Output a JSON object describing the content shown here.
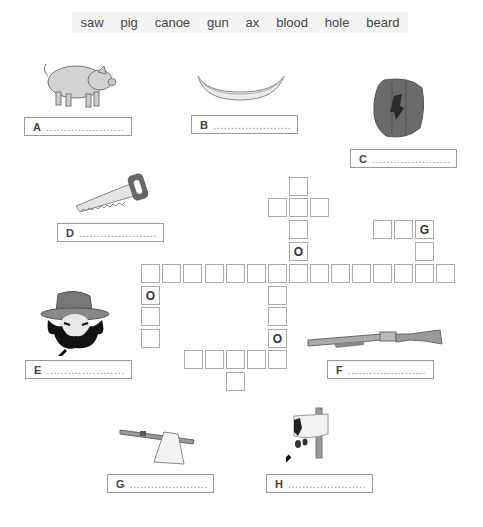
{
  "word_bank": [
    "saw",
    "pig",
    "canoe",
    "gun",
    "ax",
    "blood",
    "hole",
    "beard"
  ],
  "answer_boxes": [
    {
      "label": "A",
      "dots": "......................",
      "picture": "pig"
    },
    {
      "label": "B",
      "dots": "......................",
      "picture": "canoe"
    },
    {
      "label": "C",
      "dots": "......................",
      "picture": "hole"
    },
    {
      "label": "D",
      "dots": "......................",
      "picture": "saw"
    },
    {
      "label": "E",
      "dots": "......................",
      "picture": "beard"
    },
    {
      "label": "F",
      "dots": "......................",
      "picture": "gun"
    },
    {
      "label": "G",
      "dots": "......................",
      "picture": "ax"
    },
    {
      "label": "H",
      "dots": "......................",
      "picture": "blood"
    }
  ],
  "crossword": {
    "given_letters": {
      "o1": "O",
      "o2": "O",
      "o3": "O",
      "g1": "G"
    }
  },
  "colors": {
    "cell_border": "#aaaaaa",
    "box_border": "#999999",
    "wordbank_bg": "#f4f4f4"
  }
}
